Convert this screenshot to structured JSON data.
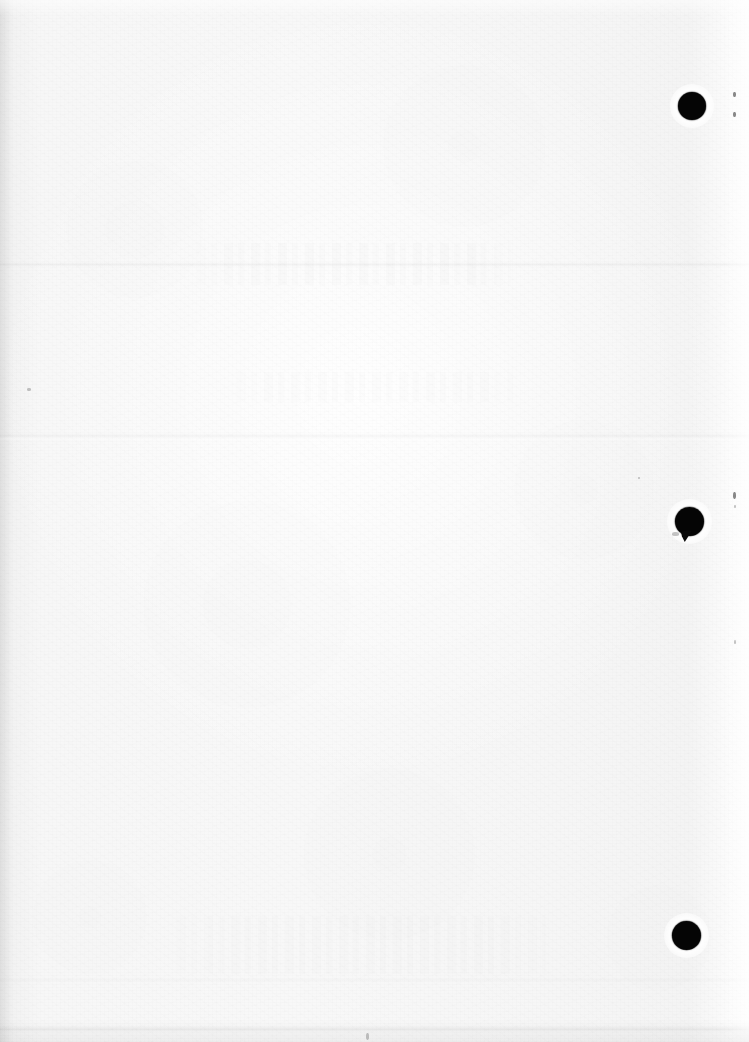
{
  "document": {
    "page_kind": "scanned-blank-page",
    "orientation": "portrait",
    "width_px": 749,
    "height_px": 1042,
    "visible_text": "",
    "paper_color": "#f6f6f6",
    "ink_color": "#050505"
  },
  "marks": {
    "binding_holes": [
      {
        "name": "top-binding-hole",
        "cx": 692,
        "cy": 106,
        "d": 28,
        "has_tail": false
      },
      {
        "name": "middle-binding-hole",
        "cx": 689,
        "cy": 521,
        "d": 29,
        "has_tail": true
      },
      {
        "name": "bottom-binding-hole",
        "cx": 686,
        "cy": 935,
        "d": 29,
        "has_tail": false
      }
    ],
    "creases": [
      {
        "name": "upper-crease",
        "y": 262,
        "strength": "faint"
      },
      {
        "name": "middle-crease",
        "y": 433,
        "strength": "faint"
      },
      {
        "name": "lower-crease",
        "y": 978,
        "strength": "faint"
      },
      {
        "name": "bottom-edge-crease",
        "y": 1026,
        "strength": "light"
      }
    ],
    "specks": [
      {
        "name": "speck-right-upper-a",
        "x": 733,
        "y": 92,
        "w": 3,
        "h": 5
      },
      {
        "name": "speck-right-upper-b",
        "x": 733,
        "y": 112,
        "w": 3,
        "h": 5
      },
      {
        "name": "speck-right-mid-a",
        "x": 733,
        "y": 492,
        "w": 3,
        "h": 7
      },
      {
        "name": "speck-right-mid-b",
        "x": 734,
        "y": 505,
        "w": 2,
        "h": 3
      },
      {
        "name": "speck-right-lower",
        "x": 734,
        "y": 640,
        "w": 2,
        "h": 4
      },
      {
        "name": "speck-left-margin",
        "x": 27,
        "y": 388,
        "w": 4,
        "h": 3
      },
      {
        "name": "speck-centre",
        "x": 366,
        "y": 1033,
        "w": 3,
        "h": 7
      },
      {
        "name": "speck-mid-right",
        "x": 638,
        "y": 477,
        "w": 2,
        "h": 2
      }
    ],
    "bleed_through": [
      {
        "name": "ghost-band-upper",
        "x": 170,
        "y": 243,
        "w": 370,
        "h": 42
      },
      {
        "name": "ghost-band-middle",
        "x": 210,
        "y": 372,
        "w": 330,
        "h": 30
      },
      {
        "name": "ghost-band-lower",
        "x": 150,
        "y": 916,
        "w": 430,
        "h": 58
      }
    ]
  }
}
